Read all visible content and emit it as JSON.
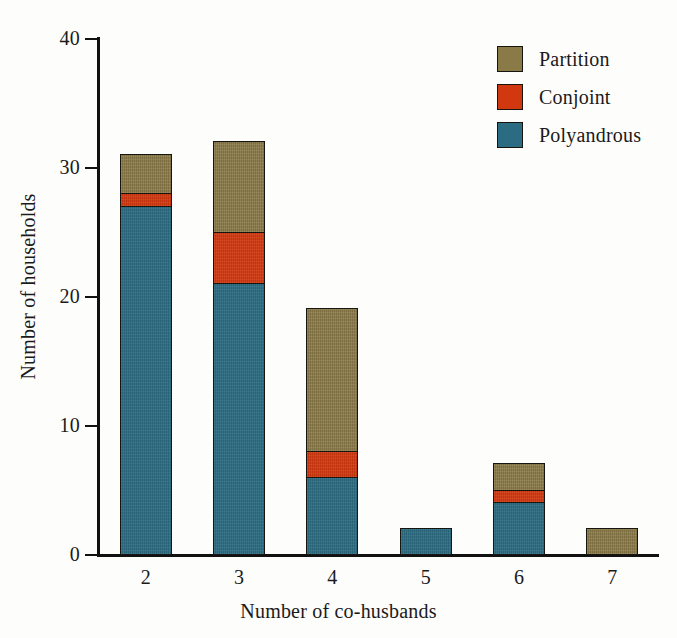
{
  "chart_data": {
    "type": "bar",
    "subtype": "stacked-bar",
    "title": "",
    "xlabel": "Number of co-husbands",
    "ylabel": "Number of households",
    "categories": [
      "2",
      "3",
      "4",
      "5",
      "6",
      "7"
    ],
    "series": [
      {
        "name": "Polyandrous",
        "color": "#2c6c82",
        "values": [
          27,
          21,
          6,
          2,
          4,
          0
        ]
      },
      {
        "name": "Conjoint",
        "color": "#d2380f",
        "values": [
          1,
          4,
          2,
          0,
          1,
          0
        ]
      },
      {
        "name": "Partition",
        "color": "#8a7a48",
        "values": [
          3,
          7,
          11,
          0,
          2,
          2
        ]
      }
    ],
    "stack_order_bottom_to_top": [
      "Polyandrous",
      "Conjoint",
      "Partition"
    ],
    "totals": [
      31,
      32,
      19,
      2,
      7,
      2
    ],
    "ylim": [
      0,
      40
    ],
    "yticks": [
      0,
      10,
      20,
      30,
      40
    ],
    "ytick_labels": [
      "0",
      "10",
      "20",
      "30",
      "40"
    ],
    "xtick_labels": [
      "2",
      "3",
      "4",
      "5",
      "6",
      "7"
    ],
    "grid": false,
    "legend_position": "top-right",
    "legend_order_top_to_bottom": [
      "Partition",
      "Conjoint",
      "Polyandrous"
    ]
  },
  "axes": {
    "y": {
      "title": "Number of households",
      "ticks": [
        {
          "value": 40,
          "label": "40"
        },
        {
          "value": 30,
          "label": "30"
        },
        {
          "value": 20,
          "label": "20"
        },
        {
          "value": 10,
          "label": "10"
        },
        {
          "value": 0,
          "label": "0"
        }
      ]
    },
    "x": {
      "title": "Number of co-husbands",
      "ticks": [
        {
          "label": "2"
        },
        {
          "label": "3"
        },
        {
          "label": "4"
        },
        {
          "label": "5"
        },
        {
          "label": "6"
        },
        {
          "label": "7"
        }
      ]
    }
  },
  "legend": {
    "entries": [
      {
        "label": "Partition",
        "color": "#8a7a48"
      },
      {
        "label": "Conjoint",
        "color": "#d2380f"
      },
      {
        "label": "Polyandrous",
        "color": "#2c6c82"
      }
    ]
  },
  "colors": {
    "polyandrous": "#2c6c82",
    "conjoint": "#d2380f",
    "partition": "#8a7a48",
    "outline": "#17150f",
    "axis": "#111111",
    "background": "#fdfdfc"
  }
}
